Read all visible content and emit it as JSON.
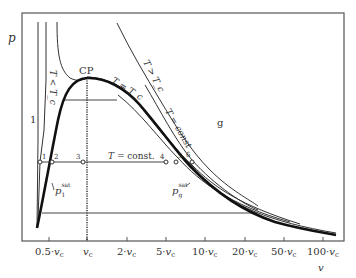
{
  "diagram": {
    "axes": {
      "y_label": "p",
      "x_label": "v",
      "x_ticks": [
        "0.5·v_c",
        "v_c",
        "2·v_c",
        "5·v_c",
        "10·v_c",
        "20·v_c",
        "50·v_c",
        "100·v_c"
      ],
      "x_tick_parts": [
        {
          "prefix": "0.5·",
          "var": "v",
          "sub": "c"
        },
        {
          "prefix": "",
          "var": "v",
          "sub": "c"
        },
        {
          "prefix": "2·",
          "var": "v",
          "sub": "c"
        },
        {
          "prefix": "5·",
          "var": "v",
          "sub": "c"
        },
        {
          "prefix": "10·",
          "var": "v",
          "sub": "c"
        },
        {
          "prefix": "20·",
          "var": "v",
          "sub": "c"
        },
        {
          "prefix": "50·",
          "var": "v",
          "sub": "c"
        },
        {
          "prefix": "100·",
          "var": "v",
          "sub": "c"
        }
      ],
      "x_scale": "logarithmic"
    },
    "labels": {
      "critical_point": "CP",
      "liquid_region": "1",
      "gas_region": "g",
      "isotherm_below_critical": "T < T_c",
      "isotherm_critical": "T = T_c",
      "isotherm_above_critical": "T > T_c",
      "isotherm_const": "T = const",
      "isobar_label": "T =  const.",
      "p_sat_liquid": {
        "var": "p",
        "sub": "1",
        "sup": "sat"
      },
      "p_sat_gas": {
        "var": "p",
        "sub": "g",
        "sup": "sat"
      }
    },
    "state_points": [
      "1",
      "2",
      "3",
      "4",
      "5",
      "6"
    ],
    "colors": {
      "line": "#333333",
      "saturation_curve": "#111111",
      "frame": "#555555",
      "background": "#ffffff"
    }
  }
}
